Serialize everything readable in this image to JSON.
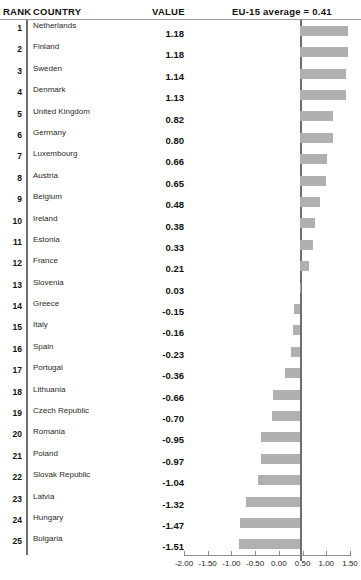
{
  "header": {
    "rank_label": "RANK",
    "country_label": "COUNTRY",
    "value_label": "VALUE",
    "average_label": "EU-15 average = 0.41"
  },
  "chart_data": {
    "type": "bar",
    "orientation": "horizontal",
    "title": "",
    "subtitle": "",
    "xlabel": "",
    "ylabel": "",
    "grid": false,
    "legend": null,
    "xlim": [
      -2.0,
      1.5
    ],
    "xticks": [
      -2.0,
      -1.5,
      -1.0,
      -0.5,
      0.0,
      0.5,
      1.0,
      1.5
    ],
    "xtick_labels": [
      "-2.00",
      "-1.50",
      "-1.00",
      "-0.50",
      "0.00",
      "0.50",
      "1.00",
      "1.50"
    ],
    "reference_line": {
      "label": "EU-15 average = 0.41",
      "value": 0.41
    },
    "bar_color": "#b0b0b0",
    "axis_color": "#8c8c8c",
    "categories": [
      "Netherlands",
      "Finland",
      "Sweden",
      "Denmark",
      "United Kingdom",
      "Germany",
      "Luxembourg",
      "Austria",
      "Belgium",
      "Ireland",
      "Estonia",
      "France",
      "Slovenia",
      "Greece",
      "Italy",
      "Spain",
      "Portugal",
      "Lithuania",
      "Czech Republic",
      "Romania",
      "Poland",
      "Slovak Republic",
      "Latvia",
      "Hungary",
      "Bulgaria"
    ],
    "values": [
      1.18,
      1.18,
      1.14,
      1.13,
      0.82,
      0.8,
      0.66,
      0.65,
      0.48,
      0.38,
      0.33,
      0.21,
      0.03,
      -0.15,
      -0.16,
      -0.23,
      -0.36,
      -0.66,
      -0.7,
      -0.95,
      -0.97,
      -1.04,
      -1.32,
      -1.47,
      -1.51
    ]
  },
  "rows": [
    {
      "rank": "1",
      "country": "Netherlands",
      "value": "1.18",
      "num": 1.18
    },
    {
      "rank": "2",
      "country": "Finland",
      "value": "1.18",
      "num": 1.18
    },
    {
      "rank": "3",
      "country": "Sweden",
      "value": "1.14",
      "num": 1.14
    },
    {
      "rank": "4",
      "country": "Denmark",
      "value": "1.13",
      "num": 1.13
    },
    {
      "rank": "5",
      "country": "United Kingdom",
      "value": "0.82",
      "num": 0.82
    },
    {
      "rank": "6",
      "country": "Germany",
      "value": "0.80",
      "num": 0.8
    },
    {
      "rank": "7",
      "country": "Luxembourg",
      "value": "0.66",
      "num": 0.66
    },
    {
      "rank": "8",
      "country": "Austria",
      "value": "0.65",
      "num": 0.65
    },
    {
      "rank": "9",
      "country": "Belgium",
      "value": "0.48",
      "num": 0.48
    },
    {
      "rank": "10",
      "country": "Ireland",
      "value": "0.38",
      "num": 0.38
    },
    {
      "rank": "11",
      "country": "Estonia",
      "value": "0.33",
      "num": 0.33
    },
    {
      "rank": "12",
      "country": "France",
      "value": "0.21",
      "num": 0.21
    },
    {
      "rank": "13",
      "country": "Slovenia",
      "value": "0.03",
      "num": 0.03
    },
    {
      "rank": "14",
      "country": "Greece",
      "value": "-0.15",
      "num": -0.15
    },
    {
      "rank": "15",
      "country": "Italy",
      "value": "-0.16",
      "num": -0.16
    },
    {
      "rank": "16",
      "country": "Spain",
      "value": "-0.23",
      "num": -0.23
    },
    {
      "rank": "17",
      "country": "Portugal",
      "value": "-0.36",
      "num": -0.36
    },
    {
      "rank": "18",
      "country": "Lithuania",
      "value": "-0.66",
      "num": -0.66
    },
    {
      "rank": "19",
      "country": "Czech Republic",
      "value": "-0.70",
      "num": -0.7
    },
    {
      "rank": "20",
      "country": "Romania",
      "value": "-0.95",
      "num": -0.95
    },
    {
      "rank": "21",
      "country": "Poland",
      "value": "-0.97",
      "num": -0.97
    },
    {
      "rank": "22",
      "country": "Slovak Republic",
      "value": "-1.04",
      "num": -1.04
    },
    {
      "rank": "23",
      "country": "Latvia",
      "value": "-1.32",
      "num": -1.32
    },
    {
      "rank": "24",
      "country": "Hungary",
      "value": "-1.47",
      "num": -1.47
    },
    {
      "rank": "25",
      "country": "Bulgaria",
      "value": "-1.51",
      "num": -1.51
    }
  ]
}
